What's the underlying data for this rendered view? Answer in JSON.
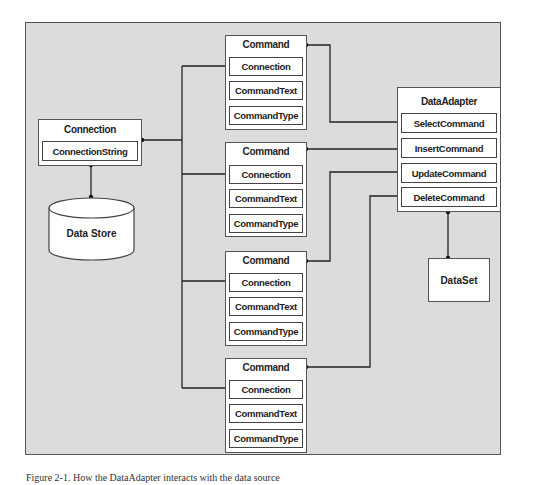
{
  "diagram": {
    "connection": {
      "title": "Connection",
      "property": "ConnectionString"
    },
    "data_store": {
      "label": "Data Store"
    },
    "commands": [
      {
        "title": "Command",
        "properties": [
          "Connection",
          "CommandText",
          "CommandType"
        ]
      },
      {
        "title": "Command",
        "properties": [
          "Connection",
          "CommandText",
          "CommandType"
        ]
      },
      {
        "title": "Command",
        "properties": [
          "Connection",
          "CommandText",
          "CommandType"
        ]
      },
      {
        "title": "Command",
        "properties": [
          "Connection",
          "CommandText",
          "CommandType"
        ]
      }
    ],
    "data_adapter": {
      "title": "DataAdapter",
      "properties": [
        "SelectCommand",
        "InsertCommand",
        "UpdateCommand",
        "DeleteCommand"
      ]
    },
    "dataset": {
      "label": "DataSet"
    },
    "colors": {
      "panel": "#dcdcdc",
      "border": "#555555",
      "line": "#222222",
      "box": "#ffffff"
    }
  },
  "caption": "Figure 2-1. How the DataAdapter interacts with the data source"
}
